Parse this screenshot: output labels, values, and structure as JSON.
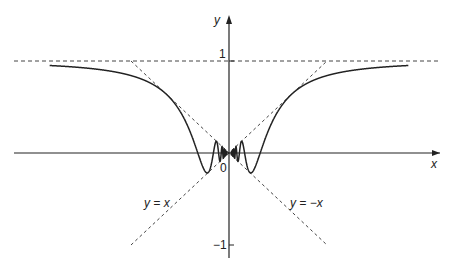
{
  "chart_data": {
    "type": "line",
    "title": "",
    "function": "y = x sin(1/x)",
    "xlabel": "x",
    "ylabel": "y",
    "ylim": [
      -1,
      1
    ],
    "y_ticks": [
      "1",
      "-1"
    ],
    "origin_label": "0",
    "grid": false,
    "asymptotes": [
      {
        "name": "y = 1",
        "style": "dashed"
      },
      {
        "name": "y = x",
        "style": "dashed",
        "label": "y = x"
      },
      {
        "name": "y = -x",
        "style": "dashed",
        "label": "y = −x"
      }
    ],
    "x_range": [
      -1.83,
      1.83
    ]
  },
  "labels": {
    "x_axis": "x",
    "y_axis": "y",
    "tick_one": "1",
    "tick_neg_one": "−1",
    "origin": "0",
    "line_pos": "y = x",
    "line_neg": "y = −x"
  },
  "colors": {
    "ink": "#222222",
    "dash": "#444444"
  }
}
